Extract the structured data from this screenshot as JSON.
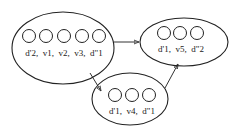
{
  "diagram": {
    "type": "state-graph",
    "nodes": [
      {
        "id": "A",
        "label": "d'2,  v1,  v2,  v3,  d\"1",
        "slots": 5
      },
      {
        "id": "B",
        "label": "d'1,  v5,  d\"2",
        "slots": 3
      },
      {
        "id": "C",
        "label": "d'1,  v4,  d\"1",
        "slots": 3
      }
    ],
    "edges": [
      {
        "from": "A",
        "to": "B"
      },
      {
        "from": "A",
        "to": "C"
      },
      {
        "from": "C",
        "to": "B"
      }
    ]
  }
}
